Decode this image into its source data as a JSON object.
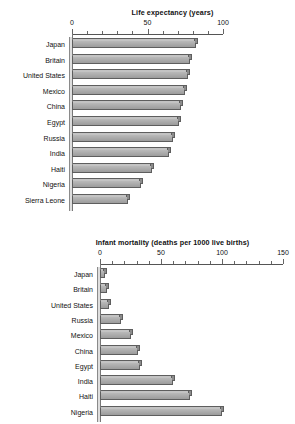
{
  "chart_data": [
    {
      "type": "bar",
      "orientation": "horizontal",
      "title": "Life expectancy (years)",
      "xlabel": "",
      "ylabel": "",
      "xlim": [
        0,
        100
      ],
      "xticks": [
        0,
        50,
        100
      ],
      "xtick_labels": [
        "0",
        "50",
        "100"
      ],
      "minor_tick_step": 10,
      "grid": false,
      "legend": "none",
      "categories": [
        "Japan",
        "Britain",
        "United States",
        "Mexico",
        "China",
        "Egypt",
        "Russia",
        "India",
        "Haiti",
        "Nigeria",
        "Sierra Leone"
      ],
      "values": [
        82,
        78,
        77,
        75,
        72,
        71,
        67,
        64,
        53,
        46,
        37
      ]
    },
    {
      "type": "bar",
      "orientation": "horizontal",
      "title": "Infant mortality (deaths per 1000 live births)",
      "xlabel": "",
      "ylabel": "",
      "xlim": [
        0,
        150
      ],
      "xticks": [
        0,
        50,
        100,
        150
      ],
      "xtick_labels": [
        "0",
        "50",
        "100",
        "150"
      ],
      "minor_tick_step": 10,
      "grid": false,
      "legend": "none",
      "categories": [
        "Japan",
        "Britain",
        "United States",
        "Russia",
        "Mexico",
        "China",
        "Egypt",
        "India",
        "Haiti",
        "Nigeria"
      ],
      "values": [
        4,
        6,
        7,
        17,
        25,
        31,
        33,
        60,
        74,
        100
      ]
    }
  ],
  "style": {
    "bar_fill": "#aeaeae",
    "bar_edge": "#5e5e5e",
    "axis_color": "#555555",
    "text_color": "#111111",
    "background": "#ffffff"
  }
}
